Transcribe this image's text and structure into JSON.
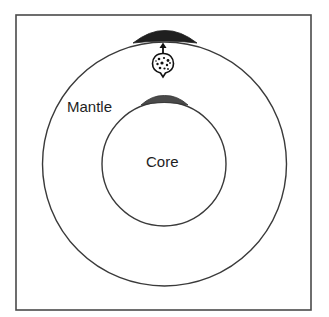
{
  "diagram": {
    "type": "cross-section",
    "labels": {
      "mantle": "Mantle",
      "core": "Core"
    },
    "colors": {
      "stroke": "#3a3a3a",
      "frame": "#4a4a4a",
      "surface_lens": "#1f1f1f",
      "core_lens": "#4a4a4a",
      "background": "#ffffff"
    },
    "shapes": {
      "frame": {
        "x": 16,
        "y": 15,
        "width": 295,
        "height": 295
      },
      "outer_circle": {
        "cx": 164.5,
        "cy": 164,
        "r": 122
      },
      "inner_circle": {
        "cx": 164,
        "cy": 164,
        "r": 62
      },
      "surface_lens": {
        "x1": 133,
        "x2": 197,
        "y_base": 42,
        "y_top": 31
      },
      "core_lens": {
        "x1": 141,
        "x2": 188,
        "y_base": 104,
        "y_top": 96
      },
      "plume": {
        "cx": 163,
        "cy": 64,
        "arrow_from": 53,
        "arrow_to": 43
      }
    }
  }
}
